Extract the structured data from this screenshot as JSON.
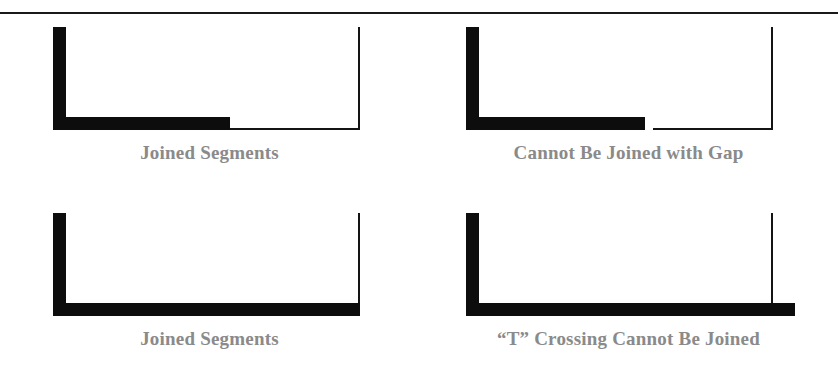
{
  "figure": {
    "divider": {
      "name": "horizontal-rule",
      "color": "#1a1a1a"
    },
    "stroke_color": "#0d0d0d",
    "caption_color": "#8a8a8a",
    "background": "#ffffff",
    "panels": [
      {
        "id": "joined-segments-top",
        "caption": "Joined Segments",
        "condition": "joined",
        "description": "Thick L-shaped polyline whose horizontal arm meets a thin horizontal segment end to end, which turns up into a thin vertical segment.",
        "thick_vertical": {
          "x": 53,
          "y": 27,
          "width": 13,
          "height": 103
        },
        "thick_horizontal": {
          "x": 53,
          "y": 117,
          "width": 177,
          "height": 13
        },
        "thin_horizontal": {
          "x": 230,
          "y": 128,
          "width": 130,
          "height": 2
        },
        "thin_vertical": {
          "x": 358,
          "y": 27,
          "width": 2,
          "height": 103
        },
        "gap": 0
      },
      {
        "id": "cannot-be-joined-with-gap",
        "caption": "Cannot Be Joined with Gap",
        "condition": "gap",
        "description": "Thick L-shaped polyline whose horizontal arm stops short of a thin horizontal segment, leaving a visible gap between the two endpoints.",
        "thick_vertical": {
          "x": 466,
          "y": 27,
          "width": 13,
          "height": 103
        },
        "thick_horizontal": {
          "x": 466,
          "y": 117,
          "width": 179,
          "height": 13
        },
        "thin_horizontal": {
          "x": 653,
          "y": 128,
          "width": 120,
          "height": 2
        },
        "thin_vertical": {
          "x": 771,
          "y": 27,
          "width": 2,
          "height": 103
        },
        "gap": 8
      },
      {
        "id": "joined-segments-bottom",
        "caption": "Joined Segments",
        "condition": "joined",
        "description": "Thick U-shaped polyline: a thick vertical arm, a thick horizontal bottom bar ending flush at a thin vertical segment rising from its right end.",
        "thick_vertical": {
          "x": 53,
          "y": 213,
          "width": 13,
          "height": 103
        },
        "thick_horizontal": {
          "x": 53,
          "y": 303,
          "width": 307,
          "height": 13
        },
        "thin_horizontal": null,
        "thin_vertical": {
          "x": 358,
          "y": 213,
          "width": 2,
          "height": 90
        },
        "gap": 0
      },
      {
        "id": "t-crossing-cannot-be-joined",
        "caption": "“T” Crossing Cannot Be Joined",
        "condition": "t-crossing",
        "description": "Thick L-shaped polyline whose horizontal bottom bar runs past a thin vertical segment that lands on top of it, forming a T intersection rather than an endpoint join.",
        "thick_vertical": {
          "x": 466,
          "y": 213,
          "width": 13,
          "height": 103
        },
        "thick_horizontal": {
          "x": 466,
          "y": 303,
          "width": 329,
          "height": 13
        },
        "thin_horizontal": null,
        "thin_vertical": {
          "x": 771,
          "y": 213,
          "width": 2,
          "height": 90
        },
        "gap": 0
      }
    ]
  }
}
